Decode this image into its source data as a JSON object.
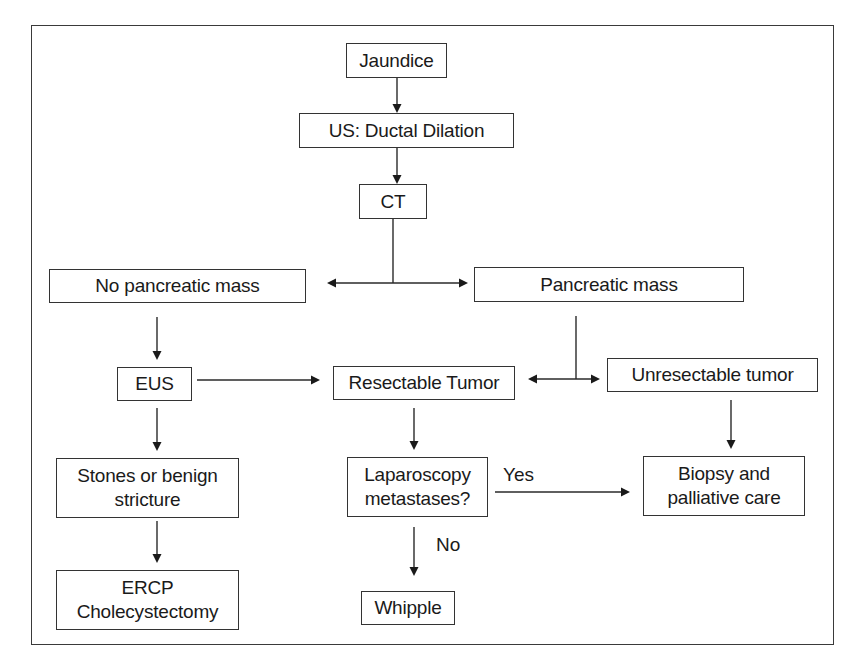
{
  "diagram": {
    "type": "flowchart",
    "title": "",
    "nodes": {
      "jaundice": {
        "label": "Jaundice"
      },
      "us": {
        "label": "US: Ductal Dilation"
      },
      "ct": {
        "label": "CT"
      },
      "no_mass": {
        "label": "No pancreatic mass"
      },
      "mass": {
        "label": "Pancreatic mass"
      },
      "eus": {
        "label": "EUS"
      },
      "resectable": {
        "label": "Resectable Tumor"
      },
      "unresectable": {
        "label": "Unresectable tumor"
      },
      "stones": {
        "label": "Stones or benign\nstricture"
      },
      "laparoscopy": {
        "label": "Laparoscopy\nmetastases?"
      },
      "biopsy": {
        "label": "Biopsy and\npalliative care"
      },
      "ercp": {
        "label": "ERCP\nCholecystectomy"
      },
      "whipple": {
        "label": "Whipple"
      }
    },
    "edge_labels": {
      "yes": "Yes",
      "no": "No"
    },
    "edges": [
      {
        "from": "Jaundice",
        "to": "US: Ductal Dilation"
      },
      {
        "from": "US: Ductal Dilation",
        "to": "CT"
      },
      {
        "from": "CT",
        "to": "No pancreatic mass"
      },
      {
        "from": "CT",
        "to": "Pancreatic mass"
      },
      {
        "from": "No pancreatic mass",
        "to": "EUS"
      },
      {
        "from": "EUS",
        "to": "Resectable Tumor"
      },
      {
        "from": "EUS",
        "to": "Stones or benign stricture"
      },
      {
        "from": "Stones or benign stricture",
        "to": "ERCP Cholecystectomy"
      },
      {
        "from": "Pancreatic mass",
        "to": "Resectable Tumor"
      },
      {
        "from": "Pancreatic mass",
        "to": "Unresectable tumor"
      },
      {
        "from": "Resectable Tumor",
        "to": "Laparoscopy metastases?"
      },
      {
        "from": "Laparoscopy metastases?",
        "to": "Biopsy and palliative care",
        "label": "Yes"
      },
      {
        "from": "Laparoscopy metastases?",
        "to": "Whipple",
        "label": "No"
      },
      {
        "from": "Unresectable tumor",
        "to": "Biopsy and palliative care"
      }
    ]
  }
}
